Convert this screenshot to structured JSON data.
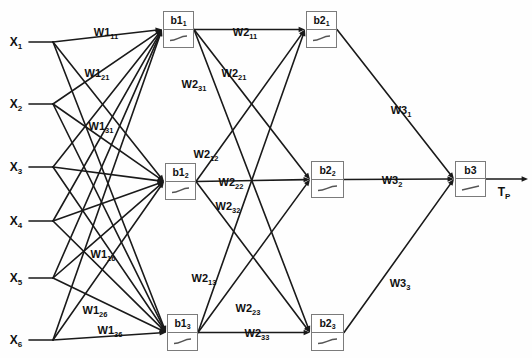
{
  "diagram": {
    "type": "neural-network-architecture",
    "title": "",
    "background_color": "#fefefe",
    "line_color": "#1a1a1a",
    "box_border_color": "#7b7b7b",
    "box_fill_color": "#ffffff"
  },
  "inputs": [
    {
      "id": "x1",
      "base": "X",
      "sub": "1",
      "x": 16,
      "y": 42,
      "fan_x": 53
    },
    {
      "id": "x2",
      "base": "X",
      "sub": "2",
      "x": 16,
      "y": 104,
      "fan_x": 53
    },
    {
      "id": "x3",
      "base": "X",
      "sub": "3",
      "x": 16,
      "y": 167,
      "fan_x": 53
    },
    {
      "id": "x4",
      "base": "X",
      "sub": "4",
      "x": 16,
      "y": 221,
      "fan_x": 53
    },
    {
      "id": "x5",
      "base": "X",
      "sub": "5",
      "x": 16,
      "y": 278,
      "fan_x": 53
    },
    {
      "id": "x6",
      "base": "X",
      "sub": "6",
      "x": 16,
      "y": 340,
      "fan_x": 53
    }
  ],
  "hidden_layer_1": [
    {
      "id": "b1_1",
      "base": "b1",
      "sub": "1",
      "x": 163,
      "y": 11,
      "w": 31,
      "h": 37,
      "activation": "sigmoid"
    },
    {
      "id": "b1_2",
      "base": "b1",
      "sub": "2",
      "x": 165,
      "y": 163,
      "w": 31,
      "h": 37,
      "activation": "sigmoid"
    },
    {
      "id": "b1_3",
      "base": "b1",
      "sub": "3",
      "x": 167,
      "y": 314,
      "w": 31,
      "h": 37,
      "activation": "sigmoid"
    }
  ],
  "hidden_layer_2": [
    {
      "id": "b2_1",
      "base": "b2",
      "sub": "1",
      "x": 306,
      "y": 11,
      "w": 31,
      "h": 37,
      "activation": "sigmoid"
    },
    {
      "id": "b2_2",
      "base": "b2",
      "sub": "2",
      "x": 311,
      "y": 161,
      "w": 33,
      "h": 37,
      "activation": "sigmoid"
    },
    {
      "id": "b2_3",
      "base": "b2",
      "sub": "3",
      "x": 311,
      "y": 314,
      "w": 33,
      "h": 37,
      "activation": "sigmoid"
    }
  ],
  "output_layer": [
    {
      "id": "b3",
      "base": "b3",
      "sub": "",
      "x": 455,
      "y": 161,
      "w": 31,
      "h": 36,
      "activation": "linear"
    }
  ],
  "output": {
    "base": "T",
    "sub": "P",
    "x": 504,
    "y": 192,
    "arrow_end_x": 528
  },
  "weight_labels": [
    {
      "id": "w1_11",
      "base": "W1",
      "sub": "11",
      "x": 106,
      "y": 32
    },
    {
      "id": "w1_21",
      "base": "W1",
      "sub": "21",
      "x": 97,
      "y": 73
    },
    {
      "id": "w1_31",
      "base": "W1",
      "sub": "31",
      "x": 101,
      "y": 126
    },
    {
      "id": "w1_16",
      "base": "W1",
      "sub": "16",
      "x": 103,
      "y": 254
    },
    {
      "id": "w1_26",
      "base": "W1",
      "sub": "26",
      "x": 95,
      "y": 310
    },
    {
      "id": "w1_36",
      "base": "W1",
      "sub": "36",
      "x": 110,
      "y": 330
    },
    {
      "id": "w2_11",
      "base": "W2",
      "sub": "11",
      "x": 245,
      "y": 32
    },
    {
      "id": "w2_21",
      "base": "W2",
      "sub": "21",
      "x": 234,
      "y": 73
    },
    {
      "id": "w2_31",
      "base": "W2",
      "sub": "31",
      "x": 194,
      "y": 84
    },
    {
      "id": "w2_12",
      "base": "W2",
      "sub": "12",
      "x": 206,
      "y": 154
    },
    {
      "id": "w2_22",
      "base": "W2",
      "sub": "22",
      "x": 231,
      "y": 182
    },
    {
      "id": "w2_32",
      "base": "W2",
      "sub": "32",
      "x": 228,
      "y": 206
    },
    {
      "id": "w2_13",
      "base": "W2",
      "sub": "13",
      "x": 204,
      "y": 278
    },
    {
      "id": "w2_23",
      "base": "W2",
      "sub": "23",
      "x": 248,
      "y": 308
    },
    {
      "id": "w2_33",
      "base": "W2",
      "sub": "33",
      "x": 257,
      "y": 333
    },
    {
      "id": "w3_1",
      "base": "W3",
      "sub": "1",
      "x": 401,
      "y": 110
    },
    {
      "id": "w3_2",
      "base": "W3",
      "sub": "2",
      "x": 392,
      "y": 180
    },
    {
      "id": "w3_3",
      "base": "W3",
      "sub": "3",
      "x": 400,
      "y": 283
    }
  ]
}
